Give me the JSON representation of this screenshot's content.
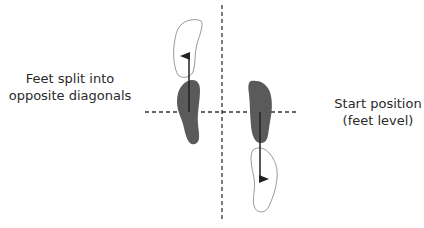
{
  "diagram": {
    "labels": {
      "left_line1": "Feet split into",
      "left_line2": "opposite diagonals",
      "right_line1": "Start position",
      "right_line2": "(feet level)"
    },
    "colors": {
      "solid_foot": "#5a5a5a",
      "outline_foot": "#9a9a9a",
      "dashed_line": "#333333",
      "arrow": "#222222"
    },
    "elements": [
      {
        "type": "axis",
        "orientation": "vertical",
        "style": "dashed"
      },
      {
        "type": "axis",
        "orientation": "horizontal",
        "style": "dashed"
      },
      {
        "type": "foot",
        "side": "left",
        "state": "start",
        "fill": "solid"
      },
      {
        "type": "foot",
        "side": "left",
        "state": "moved-forward",
        "fill": "outline"
      },
      {
        "type": "foot",
        "side": "right",
        "state": "start",
        "fill": "solid"
      },
      {
        "type": "foot",
        "side": "right",
        "state": "moved-back",
        "fill": "outline"
      },
      {
        "type": "arrow",
        "direction": "up"
      },
      {
        "type": "arrow",
        "direction": "down"
      }
    ]
  }
}
